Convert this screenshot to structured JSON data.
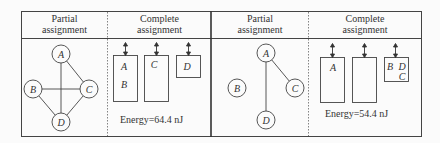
{
  "panels": [
    {
      "partial_header": "Partial\nassignment",
      "partial_header_l1": "Partial",
      "partial_header_l2": "assignment",
      "complete_header_l1": "Complete",
      "complete_header_l2": "assignment",
      "graph": {
        "nodes": [
          {
            "id": "A",
            "x": 61,
            "y": 54
          },
          {
            "id": "B",
            "x": 33,
            "y": 89
          },
          {
            "id": "C",
            "x": 89,
            "y": 89
          },
          {
            "id": "D",
            "x": 61,
            "y": 122
          }
        ],
        "edges": [
          [
            "A",
            "C"
          ],
          [
            "A",
            "D"
          ],
          [
            "B",
            "C"
          ],
          [
            "B",
            "D"
          ],
          [
            "C",
            "D"
          ]
        ]
      },
      "slots": [
        {
          "labels": [
            "A",
            "B"
          ]
        },
        {
          "labels": [
            "C"
          ]
        },
        {
          "labels": [
            "D"
          ]
        }
      ],
      "energy": "Energy=64.4 nJ"
    },
    {
      "partial_header_l1": "Partial",
      "partial_header_l2": "assignment",
      "complete_header_l1": "Complete",
      "complete_header_l2": "assignment",
      "graph": {
        "nodes": [
          {
            "id": "A",
            "x": 266,
            "y": 53
          },
          {
            "id": "B",
            "x": 237,
            "y": 88
          },
          {
            "id": "C",
            "x": 295,
            "y": 88
          },
          {
            "id": "D",
            "x": 266,
            "y": 120
          }
        ],
        "edges": [
          [
            "A",
            "C"
          ],
          [
            "A",
            "D"
          ]
        ]
      },
      "slots": [
        {
          "labels": [
            "A"
          ]
        },
        {
          "labels": []
        },
        {
          "labels": [
            "B",
            "D",
            "C"
          ]
        }
      ],
      "energy": "Energy=54.4 nJ"
    }
  ]
}
